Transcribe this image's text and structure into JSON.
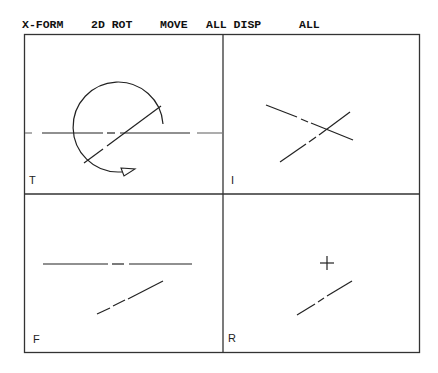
{
  "menu": {
    "items": [
      {
        "label": "X-FORM",
        "x": 22
      },
      {
        "label": "2D ROT",
        "x": 91
      },
      {
        "label": "MOVE",
        "x": 160
      },
      {
        "label": "ALL DISP",
        "x": 206
      },
      {
        "label": "ALL",
        "x": 299
      }
    ]
  },
  "viewports": [
    {
      "id": "top",
      "label": "T"
    },
    {
      "id": "isometric",
      "label": "I"
    },
    {
      "id": "front",
      "label": "F"
    },
    {
      "id": "right",
      "label": "R"
    }
  ],
  "colors": {
    "background": "#ffffff",
    "line": "#222222",
    "frame": "#333333"
  }
}
